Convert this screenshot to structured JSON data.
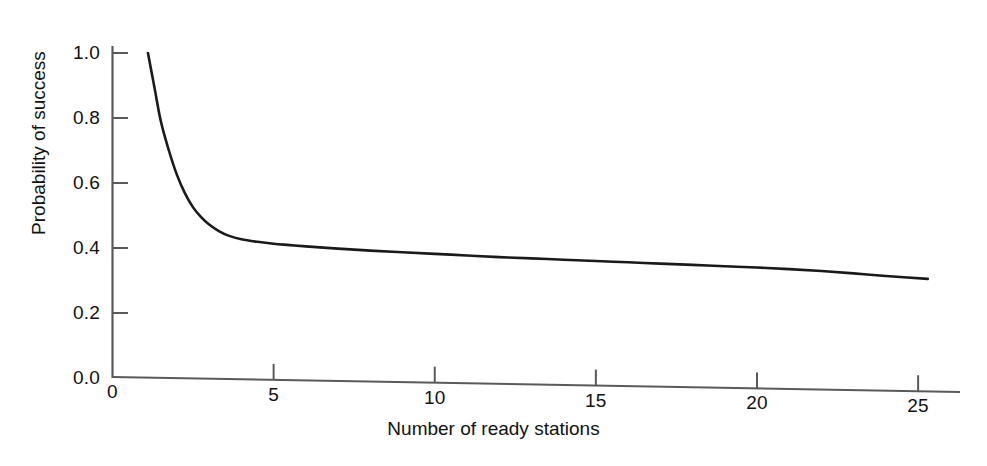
{
  "figure": {
    "background_color": "#ffffff",
    "line_color": "#1a1a1a",
    "axis_color": "#5a5a5a"
  },
  "chart_data": {
    "type": "line",
    "title": "",
    "xlabel": "Number of ready stations",
    "ylabel": "Probability of success",
    "xlim": [
      0,
      26.3
    ],
    "ylim": [
      0.0,
      1.06
    ],
    "grid": false,
    "legend": null,
    "xticks": [
      0,
      5,
      10,
      15,
      20,
      25
    ],
    "xtick_labels": [
      "0",
      "5",
      "10",
      "15",
      "20",
      "25"
    ],
    "yticks": [
      0.0,
      0.2,
      0.4,
      0.6,
      0.8,
      1.0
    ],
    "ytick_labels": [
      "0.0",
      "0.2",
      "0.4",
      "0.6",
      "0.8",
      "1.0"
    ],
    "series": [
      {
        "name": "Probability of success",
        "x": [
          1.1,
          1.3,
          1.5,
          1.75,
          2.0,
          2.25,
          2.5,
          2.75,
          3.0,
          3.3,
          3.6,
          4.0,
          4.5,
          5.0,
          5.5,
          6.0,
          7.0,
          8.0,
          9.0,
          10.0,
          11.0,
          12.0,
          13.0,
          14.0,
          15.0,
          16.0,
          17.0,
          18.0,
          19.0,
          20.0,
          21.0,
          22.0,
          23.0,
          24.0,
          25.3
        ],
        "y": [
          1.0,
          0.895,
          0.79,
          0.7,
          0.625,
          0.568,
          0.525,
          0.495,
          0.472,
          0.452,
          0.438,
          0.427,
          0.419,
          0.413,
          0.409,
          0.405,
          0.398,
          0.392,
          0.387,
          0.382,
          0.377,
          0.372,
          0.368,
          0.364,
          0.36,
          0.356,
          0.352,
          0.348,
          0.344,
          0.34,
          0.335,
          0.329,
          0.322,
          0.314,
          0.305
        ]
      }
    ]
  },
  "axis_labels": {
    "x_title": "Number of ready stations",
    "y_title": "Probability of success"
  }
}
